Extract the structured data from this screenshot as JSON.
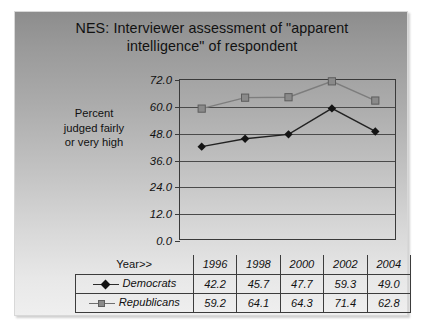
{
  "slide": {
    "title": "NES:  Interviewer assessment of \"apparent intelligence\" of respondent",
    "title_line1": "NES:  Interviewer assessment of \"apparent",
    "title_line2": "intelligence\" of respondent",
    "y_axis_label_line1": "Percent",
    "y_axis_label_line2": "judged fairly",
    "y_axis_label_line3": "or very high",
    "year_header_label": "Year>>"
  },
  "colors": {
    "democrats": "#111111",
    "republicans": "#8a8a8a",
    "axis": "#3a3a3a",
    "grid": "#4a4a4a",
    "text": "#111111"
  },
  "chart_data": {
    "type": "line",
    "title": "NES:  Interviewer assessment of \"apparent intelligence\" of respondent",
    "xlabel": "Year>>",
    "ylabel": "Percent judged fairly or very high",
    "categories": [
      "1996",
      "1998",
      "2000",
      "2002",
      "2004"
    ],
    "series": [
      {
        "name": "Democrats",
        "marker": "diamond",
        "color": "#111111",
        "values": [
          42.2,
          45.7,
          47.7,
          59.3,
          49.0
        ]
      },
      {
        "name": "Republicans",
        "marker": "square",
        "color": "#8a8a8a",
        "values": [
          59.2,
          64.1,
          64.3,
          71.4,
          62.8
        ]
      }
    ],
    "ylim": [
      0.0,
      72.0
    ],
    "yticks": [
      "0.0",
      "12.0",
      "24.0",
      "36.0",
      "48.0",
      "60.0",
      "72.0"
    ],
    "ytick_values": [
      0.0,
      12.0,
      24.0,
      36.0,
      48.0,
      60.0,
      72.0
    ],
    "grid": true,
    "legend": "data-table"
  }
}
